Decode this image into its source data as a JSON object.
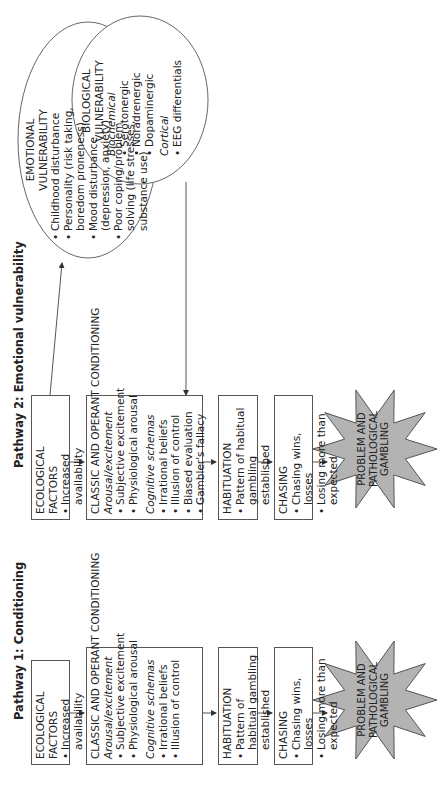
{
  "pathway1": {
    "title": "Pathway 1: Conditioning",
    "ecological": {
      "heading": "ECOLOGICAL FACTORS",
      "items": [
        "Increased availability",
        "Increased accessibility"
      ]
    },
    "conditioning": {
      "heading": "CLASSIC AND OPERANT CONDITIONING",
      "sub1": "Arousal/excitement",
      "sub1_items": [
        "Subjective excitement",
        "Physiological arousal"
      ],
      "sub2": "Cognitive schemas",
      "sub2_items": [
        "Irrational beliefs",
        "Illusion of control"
      ]
    },
    "habituation": {
      "heading": "HABITUATION",
      "items": [
        "Pattern of habitual gambling established"
      ]
    },
    "chasing": {
      "heading": "CHASING",
      "items": [
        "Chasing wins, losses",
        "Losing more than expected"
      ]
    },
    "outcome": [
      "PROBLEM AND",
      "PATHOLOGICAL",
      "GAMBLING"
    ]
  },
  "pathway2": {
    "title": "Pathway 2: Emotional vulnerability",
    "ecological": {
      "heading": "ECOLOGICAL FACTORS",
      "items": [
        "Increased availability",
        "Increased accessibility"
      ]
    },
    "conditioning": {
      "heading": "CLASSIC AND OPERANT CONDITIONING",
      "sub1": "Arousal/excitement",
      "sub1_items": [
        "Subjective excitement",
        "Physiological arousal"
      ],
      "sub2": "Cognitive schemas",
      "sub2_items": [
        "Irrational beliefs",
        "Illusion of control",
        "Biased evaluation",
        "Gambler's fallacy"
      ]
    },
    "habituation": {
      "heading": "HABITUATION",
      "items": [
        "Pattern of habitual gambling established"
      ]
    },
    "chasing": {
      "heading": "CHASING",
      "items": [
        "Chasing wins, losses",
        "Losing more than expected"
      ]
    },
    "outcome": [
      "PROBLEM AND",
      "PATHOLOGICAL",
      "GAMBLING"
    ],
    "emotional": {
      "heading1": "EMOTIONAL",
      "heading2": "VULNERABILITY",
      "items": [
        "Childhood disturbance",
        "Personality (risk taking, boredom proneness)",
        "Mood disturbance (depression, anxiety)",
        "Poor coping/problem solving (life stresses, substance use)"
      ]
    },
    "biological": {
      "heading1": "BIOLOGICAL",
      "heading2": "VULNERABILITY",
      "sub1": "Biochemical",
      "sub1_items": [
        "Serotonergic",
        "Noradrenergic",
        "Dopaminergic"
      ],
      "sub2": "Cortical",
      "sub2_items": [
        "EEG differentials"
      ]
    }
  },
  "colors": {
    "star_fill": "#b3b3b3",
    "line": "#555555"
  }
}
